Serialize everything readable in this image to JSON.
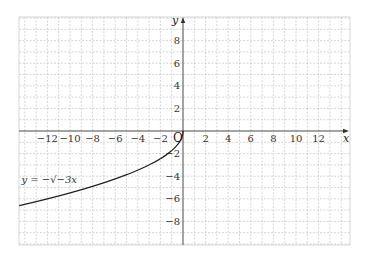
{
  "chart_data": {
    "type": "line",
    "title": "",
    "xlabel": "x",
    "ylabel": "y",
    "origin_label": "O",
    "xlim": [
      -14.5,
      14.8
    ],
    "ylim": [
      -10,
      10
    ],
    "grid": true,
    "grid_step": 1,
    "x_ticks": [
      -12,
      -10,
      -8,
      -6,
      -4,
      -2,
      2,
      4,
      6,
      8,
      10,
      12
    ],
    "x_tick_labels": [
      "−12",
      "−10",
      "−8",
      "−6",
      "−4",
      "−2",
      "2",
      "4",
      "6",
      "8",
      "10",
      "12"
    ],
    "y_ticks": [
      8,
      6,
      4,
      2,
      -2,
      -4,
      -6,
      -8
    ],
    "y_tick_labels": [
      "8",
      "6",
      "4",
      "2",
      "−2",
      "−4",
      "−6",
      "−8"
    ],
    "series": [
      {
        "name": "y = −√(−3x)",
        "label": "y = −√−3x",
        "function": "-sqrt(-3x)",
        "domain": [
          -14.5,
          0
        ],
        "x": [
          0,
          -0.5,
          -1,
          -2,
          -3,
          -4,
          -6,
          -8,
          -10,
          -12,
          -14.5
        ],
        "y": [
          0,
          -1.22,
          -1.73,
          -2.45,
          -3,
          -3.46,
          -4.24,
          -4.9,
          -5.48,
          -6,
          -6.6
        ],
        "color": "#222222"
      }
    ],
    "annotations": [
      {
        "text": "y = −√−3x",
        "x": -14.3,
        "y": -4.6
      }
    ]
  },
  "layout": {
    "plot_left": 19,
    "plot_right": 350,
    "plot_top": 17,
    "plot_bottom": 245,
    "origin_px_x": 183,
    "origin_px_y": 131,
    "unit_px": 11.3
  },
  "colors": {
    "grid": "#bbbbbb",
    "axis": "#333333",
    "curve": "#222222",
    "border": "#cccccc"
  }
}
